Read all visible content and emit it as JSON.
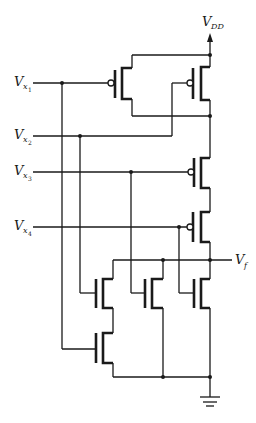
{
  "diagram": {
    "supply": {
      "label": "V",
      "subscript": "DD"
    },
    "output": {
      "label": "V",
      "subscript": "f"
    },
    "inputs": [
      {
        "label": "V",
        "subscript": "x",
        "index": "1"
      },
      {
        "label": "V",
        "subscript": "x",
        "index": "2"
      },
      {
        "label": "V",
        "subscript": "x",
        "index": "3"
      },
      {
        "label": "V",
        "subscript": "x",
        "index": "4"
      }
    ],
    "pull_up_network": [
      "PMOS x1 parallel with PMOS x2",
      "in series with PMOS x3",
      "in series with PMOS x4"
    ],
    "pull_down_network": [
      "NMOS x2 in series with NMOS x1",
      "parallel NMOS x3",
      "parallel NMOS x4"
    ],
    "ground": "ground-symbol",
    "colors": {
      "ink": "#1a1a1a",
      "background": "#ffffff"
    }
  }
}
